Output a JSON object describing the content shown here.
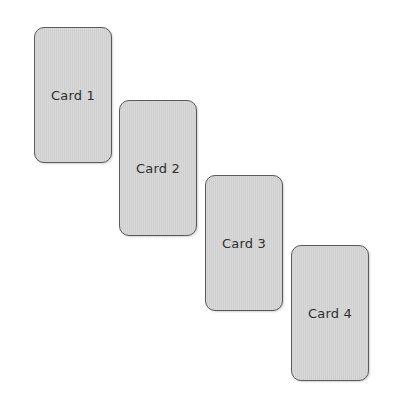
{
  "cards": [
    {
      "label": "Card 1",
      "x": 34,
      "y": 27
    },
    {
      "label": "Card 2",
      "x": 119,
      "y": 100
    },
    {
      "label": "Card 3",
      "x": 205,
      "y": 175
    },
    {
      "label": "Card 4",
      "x": 291,
      "y": 245
    }
  ],
  "colors": {
    "card_fill": "#d4d4d4",
    "card_border": "#5a5a5a",
    "label_text": "#2e2e2e",
    "background": "#ffffff"
  }
}
